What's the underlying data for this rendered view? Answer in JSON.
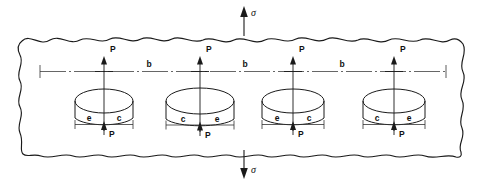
{
  "figure": {
    "type": "engineering-schematic",
    "stress": {
      "symbol": "σ",
      "top_label": "σ",
      "bottom_label": "σ",
      "top_direction": "up",
      "bottom_direction": "down"
    },
    "pitch": {
      "symbol": "b",
      "labels": [
        "b",
        "b",
        "b"
      ],
      "count": 3,
      "description": "center-to-center spacing between adjacent holes"
    },
    "load": {
      "symbol": "P",
      "top_labels": [
        "P",
        "P",
        "P",
        "P"
      ],
      "bottom_labels": [
        "P",
        "P",
        "P",
        "P"
      ],
      "count_per_hole": 2,
      "top_direction": "up",
      "bottom_direction": "up"
    },
    "holes": [
      {
        "index": 1,
        "shape": "ellipse",
        "left_dim_label": "e",
        "right_dim_label": "c",
        "center_x": 104,
        "center_y": 101,
        "rx": 29,
        "ry": 12
      },
      {
        "index": 2,
        "shape": "ellipse",
        "left_dim_label": "c",
        "right_dim_label": "e",
        "center_x": 200,
        "center_y": 101,
        "rx": 34,
        "ry": 13
      },
      {
        "index": 3,
        "shape": "ellipse",
        "left_dim_label": "e",
        "right_dim_label": "c",
        "center_x": 293,
        "center_y": 101,
        "rx": 31,
        "ry": 12
      },
      {
        "index": 4,
        "shape": "ellipse",
        "left_dim_label": "c",
        "right_dim_label": "e",
        "center_x": 394,
        "center_y": 101,
        "rx": 31,
        "ry": 12
      }
    ],
    "dimension_labels": [
      "e",
      "c",
      "c",
      "e",
      "e",
      "c",
      "c",
      "e"
    ],
    "colors": {
      "background": "#ffffff",
      "outline": "#1a1a1a",
      "thin_line": "#2b2b2b",
      "centerline": "#555555",
      "text": "#111111"
    },
    "boundary": {
      "style": "wavy-break",
      "meaning": "plate extends infinitely in all directions"
    }
  }
}
